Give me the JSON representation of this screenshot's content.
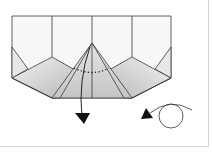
{
  "diagram": {
    "type": "origami-fold-step",
    "colors": {
      "paper": "#f7f7f7",
      "shade_light": "#e4e4e4",
      "shade_dark": "#b8b8b8",
      "line": "#3a3a3a",
      "frame": "#d8d8d8"
    },
    "symbols": [
      {
        "name": "fold-down-arrow",
        "meaning": "fold the top point down"
      },
      {
        "name": "turn-over-symbol",
        "meaning": "turn the model over"
      },
      {
        "name": "valley-fold-dotted-line",
        "meaning": "fold line"
      }
    ]
  }
}
